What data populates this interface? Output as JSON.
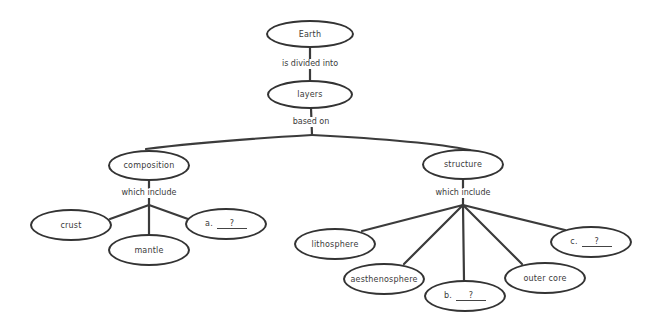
{
  "diagram": {
    "type": "concept-map",
    "nodes": {
      "earth": {
        "label": "Earth"
      },
      "layers": {
        "label": "layers"
      },
      "composition": {
        "label": "composition"
      },
      "structure": {
        "label": "structure"
      },
      "crust": {
        "label": "crust"
      },
      "mantle": {
        "label": "mantle"
      },
      "blank_a": {
        "prefix": "a.",
        "answer": "?"
      },
      "lithosphere": {
        "label": "lithosphere"
      },
      "aesthenosphere": {
        "label": "aesthenosphere"
      },
      "blank_b": {
        "prefix": "b.",
        "answer": "?"
      },
      "outer_core": {
        "label": "outer core"
      },
      "blank_c": {
        "prefix": "c.",
        "answer": "?"
      }
    },
    "links": {
      "earth_layers": "is divided into",
      "layers_children": "based on",
      "composition_children": "which include",
      "structure_children": "which include"
    },
    "colors": {
      "stroke": "#333333",
      "text": "#3a3a3a",
      "background": "#ffffff"
    }
  }
}
